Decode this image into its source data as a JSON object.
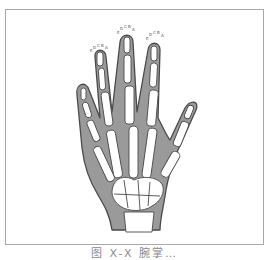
{
  "figure": {
    "caption": "图 X-X 腕掌…",
    "fingertip_labels": [
      "E",
      "D",
      "C",
      "B",
      "A"
    ],
    "labeled_fingers": [
      "index",
      "middle",
      "ring"
    ],
    "colors": {
      "soft_tissue": "#9a9a9a",
      "outline": "#4a4a4a",
      "bone": "#ffffff",
      "frame": "#a8a8a8"
    }
  }
}
